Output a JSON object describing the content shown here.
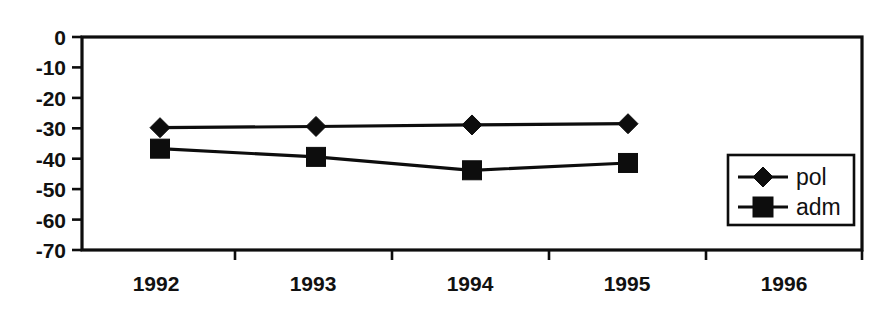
{
  "chart_data": {
    "type": "line",
    "title": "",
    "subtitle": "",
    "xlabel": "",
    "ylabel": "",
    "categories": [
      "1992",
      "1993",
      "1994",
      "1995",
      "1996"
    ],
    "x": [
      1992,
      1993,
      1994,
      1995,
      1996
    ],
    "series": [
      {
        "name": "pol",
        "marker": "diamond",
        "values": [
          -29.8,
          -29.4,
          -28.9,
          -28.5,
          null
        ]
      },
      {
        "name": "adm",
        "marker": "square",
        "values": [
          -36.7,
          -39.4,
          -43.8,
          -41.4,
          null
        ]
      }
    ],
    "ylim": [
      -70,
      0
    ],
    "ytick_labels": [
      "0",
      "-10",
      "-20",
      "-30",
      "-40",
      "-50",
      "-60",
      "-70"
    ],
    "ytick_values": [
      0,
      -10,
      -20,
      -30,
      -40,
      -50,
      -60,
      -70
    ],
    "xtick_labels": [
      "1992",
      "1993",
      "1994",
      "1995",
      "1996"
    ],
    "grid": false,
    "legend_position": "inside-bottom-right",
    "legend_entries": [
      "pol",
      "adm"
    ],
    "line_color": "#0d0d0d",
    "background_color": "#ffffff"
  },
  "axes": {
    "y": {
      "ticks": [
        {
          "label": "0",
          "value": 0
        },
        {
          "label": "-10",
          "value": -10
        },
        {
          "label": "-20",
          "value": -20
        },
        {
          "label": "-30",
          "value": -30
        },
        {
          "label": "-40",
          "value": -40
        },
        {
          "label": "-50",
          "value": -50
        },
        {
          "label": "-60",
          "value": -60
        },
        {
          "label": "-70",
          "value": -70
        }
      ]
    },
    "x": {
      "ticks": [
        {
          "label": "1992"
        },
        {
          "label": "1993"
        },
        {
          "label": "1994"
        },
        {
          "label": "1995"
        },
        {
          "label": "1996"
        }
      ]
    }
  },
  "legend": {
    "entries": [
      {
        "label": "pol",
        "marker": "diamond-marker"
      },
      {
        "label": "adm",
        "marker": "square-marker"
      }
    ]
  }
}
